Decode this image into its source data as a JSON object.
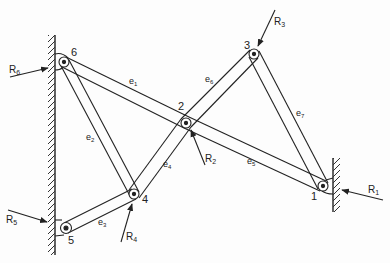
{
  "diagram": {
    "joints": [
      {
        "id": "1",
        "label": "1",
        "x": 323,
        "y": 186
      },
      {
        "id": "2",
        "label": "2",
        "x": 186,
        "y": 123
      },
      {
        "id": "3",
        "label": "3",
        "x": 254,
        "y": 54
      },
      {
        "id": "4",
        "label": "4",
        "x": 134,
        "y": 194
      },
      {
        "id": "5",
        "label": "5",
        "x": 66,
        "y": 228
      },
      {
        "id": "6",
        "label": "6",
        "x": 64,
        "y": 62
      }
    ],
    "members": [
      {
        "id": "e1",
        "label": "e",
        "sub": "1",
        "from": "6",
        "to": "2"
      },
      {
        "id": "e2",
        "label": "e",
        "sub": "2",
        "from": "6",
        "to": "4"
      },
      {
        "id": "e3",
        "label": "e",
        "sub": "3",
        "from": "5",
        "to": "4"
      },
      {
        "id": "e4",
        "label": "e",
        "sub": "4",
        "from": "4",
        "to": "2"
      },
      {
        "id": "e5",
        "label": "e",
        "sub": "5",
        "from": "2",
        "to": "1"
      },
      {
        "id": "e6",
        "label": "e",
        "sub": "6",
        "from": "2",
        "to": "3"
      },
      {
        "id": "e7",
        "label": "e",
        "sub": "7",
        "from": "3",
        "to": "1"
      }
    ],
    "forces": [
      {
        "id": "R1",
        "label": "R",
        "sub": "1",
        "at": "1"
      },
      {
        "id": "R2",
        "label": "R",
        "sub": "2",
        "at": "2"
      },
      {
        "id": "R3",
        "label": "R",
        "sub": "3",
        "at": "3"
      },
      {
        "id": "R4",
        "label": "R",
        "sub": "4",
        "at": "4"
      },
      {
        "id": "R5",
        "label": "R",
        "sub": "5",
        "at": "5"
      },
      {
        "id": "R6",
        "label": "R",
        "sub": "6",
        "at": "6"
      }
    ],
    "supports": [
      {
        "id": "left-wall",
        "side": "left"
      },
      {
        "id": "right-wall",
        "side": "right"
      }
    ],
    "colors": {
      "ink": "#222222",
      "background": "#fdfdfd"
    }
  }
}
